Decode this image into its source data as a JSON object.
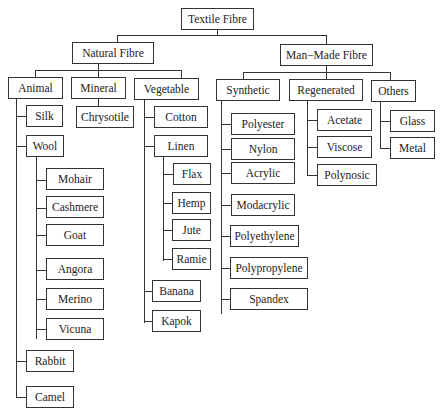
{
  "diagram": {
    "root": "Textile Fibre",
    "natural": {
      "label": "Natural Fibre",
      "animal": {
        "label": "Animal",
        "silk": "Silk",
        "wool": {
          "label": "Wool",
          "items": [
            "Mohair",
            "Cashmere",
            "Goat",
            "Angora",
            "Merino",
            "Vicuna"
          ]
        },
        "rabbit": "Rabbit",
        "camel": "Camel"
      },
      "mineral": {
        "label": "Mineral",
        "items": [
          "Chrysotile"
        ]
      },
      "vegetable": {
        "label": "Vegetable",
        "cotton": "Cotton",
        "linen": {
          "label": "Linen",
          "items": [
            "Flax",
            "Hemp",
            "Jute",
            "Ramie"
          ]
        },
        "banana": "Banana",
        "kapok": "Kapok"
      }
    },
    "manmade": {
      "label": "Man−Made Fibre",
      "synthetic": {
        "label": "Synthetic",
        "items": [
          "Polyester",
          "Nylon",
          "Acrylic",
          "Modacrylic",
          "Polyethylene",
          "Polypropylene",
          "Spandex"
        ]
      },
      "regenerated": {
        "label": "Regenerated",
        "items": [
          "Acetate",
          "Viscose",
          "Polynosic"
        ]
      },
      "others": {
        "label": "Others",
        "items": [
          "Glass",
          "Metal"
        ]
      }
    }
  }
}
